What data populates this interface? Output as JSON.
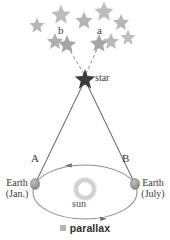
{
  "figure": {
    "caption": "parallax",
    "caption_bullet_color": "#b3b3b3",
    "background": "#ffffff",
    "labels": {
      "position_b": "b",
      "position_a": "a",
      "target_star": "star",
      "point_a": "A",
      "point_b": "B",
      "sun": "sun",
      "earth_jan_line1": "Earth",
      "earth_jan_line2": "(Jan.)",
      "earth_july_line1": "Earth",
      "earth_july_line2": "(July)"
    },
    "colors": {
      "background_stars": "#b0b0b0",
      "target_star": "#3a3a3a",
      "sight_line": "#6b6b6b",
      "dashed_line": "#8a8a8a",
      "orbit": "#8f8f8f",
      "earth_body": "#9a9a9a",
      "sun_ring": "#c9c9c9",
      "text": "#3b3b3b"
    },
    "background_stars": [
      {
        "cx": 37,
        "cy": 25,
        "r": 7.5
      },
      {
        "cx": 55,
        "cy": 41,
        "r": 8.0
      },
      {
        "cx": 61,
        "cy": 14,
        "r": 9.5
      },
      {
        "cx": 84,
        "cy": 20,
        "r": 8.5
      },
      {
        "cx": 104,
        "cy": 11,
        "r": 9.5
      },
      {
        "cx": 121,
        "cy": 22,
        "r": 8.0
      },
      {
        "cx": 128,
        "cy": 37,
        "r": 7.5
      },
      {
        "cx": 111,
        "cy": 41,
        "r": 8.0
      },
      {
        "cx": 67,
        "cy": 44,
        "r": 9.0
      },
      {
        "cx": 99,
        "cy": 43,
        "r": 9.0
      }
    ],
    "apparent_positions": [
      {
        "name": "b",
        "star_cx": 67,
        "star_cy": 44,
        "label_x": 60,
        "label_y": 31
      },
      {
        "name": "a",
        "star_cx": 99,
        "star_cy": 43,
        "label_x": 98,
        "label_y": 31
      }
    ],
    "target_star_point": {
      "cx": 85,
      "cy": 78,
      "r": 9
    },
    "star_label_pos": {
      "x": 94,
      "y": 75
    },
    "orbit": {
      "cx": 85,
      "cy": 192,
      "rx": 52,
      "ry": 27
    },
    "sun_center": {
      "cx": 85,
      "cy": 189,
      "r_outer": 12,
      "r_inner": 7
    },
    "sun_label_pos": {
      "x": 73,
      "y": 203
    },
    "earth_jan": {
      "cx": 35,
      "cy": 184,
      "rx": 4.5,
      "ry": 5.5
    },
    "earth_july": {
      "cx": 135,
      "cy": 184,
      "rx": 4.5,
      "ry": 5.5
    },
    "point_a_label_pos": {
      "x": 32,
      "y": 160
    },
    "point_b_label_pos": {
      "x": 123,
      "y": 160
    },
    "earth_jan_label_pos": {
      "x": 1,
      "y": 177
    },
    "earth_july_label_pos": {
      "x": 136,
      "y": 177
    },
    "orbit_arrows": [
      {
        "name": "top-arrow",
        "x": 69,
        "y": 165,
        "direction": "left"
      },
      {
        "name": "bottom-arrow",
        "x": 100,
        "y": 218,
        "direction": "right"
      }
    ]
  }
}
